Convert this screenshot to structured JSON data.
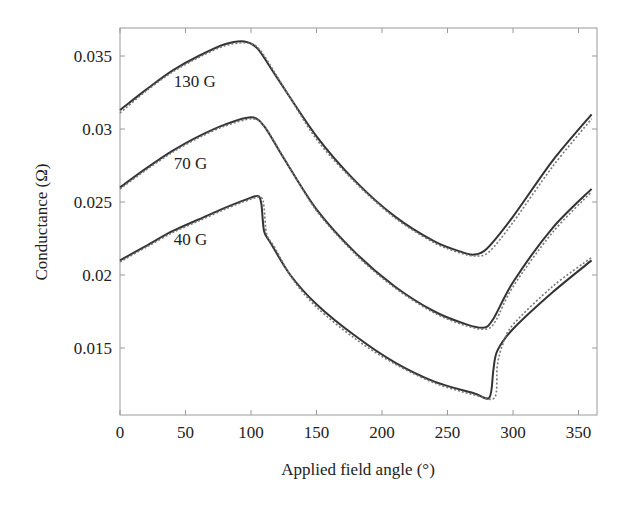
{
  "chart_data": {
    "type": "line",
    "title": "",
    "xlabel": "Applied field angle (°)",
    "ylabel": "Conductance (Ω)",
    "xlim": [
      0,
      362
    ],
    "ylim": [
      0.0104,
      0.0369
    ],
    "xticks": [
      0,
      50,
      100,
      150,
      200,
      250,
      300,
      350
    ],
    "xtick_labels": [
      "0",
      "50",
      "100",
      "150",
      "200",
      "250",
      "300",
      "350"
    ],
    "yticks": [
      0.015,
      0.02,
      0.025,
      0.03,
      0.035
    ],
    "ytick_labels": [
      "0.015",
      "0.02",
      "0.025",
      "0.03",
      "0.035"
    ],
    "grid": false,
    "legend": "none (inline curve labels)",
    "annotations": [
      {
        "text": "130 G",
        "x": 35,
        "y": 0.0333
      },
      {
        "text": "70 G",
        "x": 35,
        "y": 0.0277
      },
      {
        "text": "40 G",
        "x": 35,
        "y": 0.0225
      }
    ],
    "series": [
      {
        "name": "130 G (measured)",
        "style": "solid",
        "x": [
          0,
          20,
          40,
          60,
          80,
          95,
          105,
          120,
          150,
          180,
          210,
          240,
          260,
          270,
          280,
          300,
          330,
          360
        ],
        "y": [
          0.0313,
          0.0327,
          0.034,
          0.035,
          0.0358,
          0.036,
          0.0355,
          0.0335,
          0.0295,
          0.0264,
          0.024,
          0.0223,
          0.0216,
          0.0214,
          0.0218,
          0.024,
          0.0278,
          0.031
        ]
      },
      {
        "name": "130 G (simulated)",
        "style": "dotted",
        "x": [
          0,
          20,
          40,
          60,
          80,
          97,
          107,
          122,
          150,
          180,
          210,
          240,
          260,
          272,
          282,
          300,
          330,
          360
        ],
        "y": [
          0.0311,
          0.0326,
          0.0339,
          0.0349,
          0.0357,
          0.0359,
          0.0354,
          0.0333,
          0.0293,
          0.0263,
          0.0239,
          0.0222,
          0.0215,
          0.0213,
          0.0216,
          0.0236,
          0.0274,
          0.0307
        ]
      },
      {
        "name": "70 G (measured)",
        "style": "solid",
        "x": [
          0,
          20,
          40,
          60,
          80,
          100,
          110,
          125,
          150,
          180,
          210,
          240,
          265,
          278,
          285,
          300,
          330,
          360
        ],
        "y": [
          0.026,
          0.0273,
          0.0285,
          0.0295,
          0.0303,
          0.0308,
          0.0302,
          0.028,
          0.0245,
          0.0215,
          0.0192,
          0.0175,
          0.0166,
          0.0164,
          0.017,
          0.0195,
          0.0232,
          0.0259
        ]
      },
      {
        "name": "70 G (simulated)",
        "style": "dotted",
        "x": [
          0,
          20,
          40,
          60,
          80,
          101,
          111,
          126,
          150,
          180,
          210,
          240,
          265,
          280,
          287,
          300,
          330,
          360
        ],
        "y": [
          0.0259,
          0.0272,
          0.0284,
          0.0294,
          0.0302,
          0.0307,
          0.0301,
          0.0279,
          0.0244,
          0.0214,
          0.0191,
          0.0174,
          0.0165,
          0.0163,
          0.0169,
          0.0192,
          0.0229,
          0.0257
        ]
      },
      {
        "name": "40 G (measured)",
        "style": "solid",
        "x": [
          0,
          20,
          40,
          60,
          80,
          100,
          106,
          108,
          110,
          115,
          130,
          150,
          180,
          210,
          240,
          270,
          282,
          285,
          288,
          300,
          330,
          360
        ],
        "y": [
          0.021,
          0.022,
          0.023,
          0.0238,
          0.0246,
          0.0253,
          0.0254,
          0.0248,
          0.023,
          0.0222,
          0.02,
          0.018,
          0.0158,
          0.014,
          0.0127,
          0.0119,
          0.0116,
          0.0135,
          0.0148,
          0.0163,
          0.0188,
          0.021
        ]
      },
      {
        "name": "40 G (simulated)",
        "style": "dotted",
        "x": [
          0,
          20,
          40,
          60,
          80,
          100,
          108,
          110,
          112,
          118,
          132,
          150,
          180,
          210,
          240,
          270,
          286,
          288,
          292,
          300,
          330,
          360
        ],
        "y": [
          0.0209,
          0.0219,
          0.0229,
          0.0237,
          0.0245,
          0.0252,
          0.0253,
          0.0246,
          0.0228,
          0.0219,
          0.0197,
          0.0178,
          0.0156,
          0.0139,
          0.0126,
          0.0118,
          0.0116,
          0.0138,
          0.0152,
          0.0166,
          0.0192,
          0.0212
        ]
      }
    ]
  },
  "plot": {
    "frame": {
      "left": 120,
      "top": 28,
      "right": 597,
      "bottom": 415
    },
    "line_color": "#333333",
    "dotted_color": "#777777"
  }
}
